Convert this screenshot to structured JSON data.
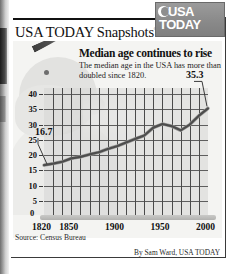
{
  "brand": {
    "snapshots_title": "USA TODAY Snapshots",
    "registered_mark": "®",
    "logo_line1": "USA",
    "logo_line2": "TODAY"
  },
  "chart_data": {
    "type": "line",
    "title": "Median age continues to rise",
    "subtitle": "The median age in the USA has more than doubled since 1820.",
    "xlabel": "",
    "ylabel": "",
    "xlim": [
      1820,
      2000
    ],
    "ylim": [
      0,
      42
    ],
    "grid": true,
    "legend": null,
    "ytick_labels": [
      "40",
      "35",
      "30",
      "25",
      "20",
      "15",
      "10",
      "5",
      "0"
    ],
    "ytick_values": [
      40,
      35,
      30,
      25,
      20,
      15,
      10,
      5,
      0
    ],
    "xtick_labels": [
      "1820",
      "1850",
      "1900",
      "1950",
      "2000"
    ],
    "xtick_values": [
      1820,
      1850,
      1900,
      1950,
      2000
    ],
    "x": [
      1820,
      1830,
      1840,
      1850,
      1860,
      1870,
      1880,
      1890,
      1900,
      1910,
      1920,
      1930,
      1940,
      1950,
      1960,
      1970,
      1980,
      1990,
      2000
    ],
    "values": [
      16.7,
      17.2,
      17.8,
      18.9,
      19.4,
      20.2,
      20.9,
      22.0,
      22.9,
      24.1,
      25.3,
      26.4,
      29.0,
      30.2,
      29.5,
      28.1,
      30.0,
      32.9,
      35.3
    ],
    "annotations": [
      {
        "label": "16.7",
        "x": 1820,
        "y": 16.7
      },
      {
        "label": "35.3",
        "x": 2000,
        "y": 35.3
      }
    ]
  },
  "footer": {
    "source": "Source: Census Bureau",
    "credit": "By Sam Ward, USA TODAY"
  }
}
